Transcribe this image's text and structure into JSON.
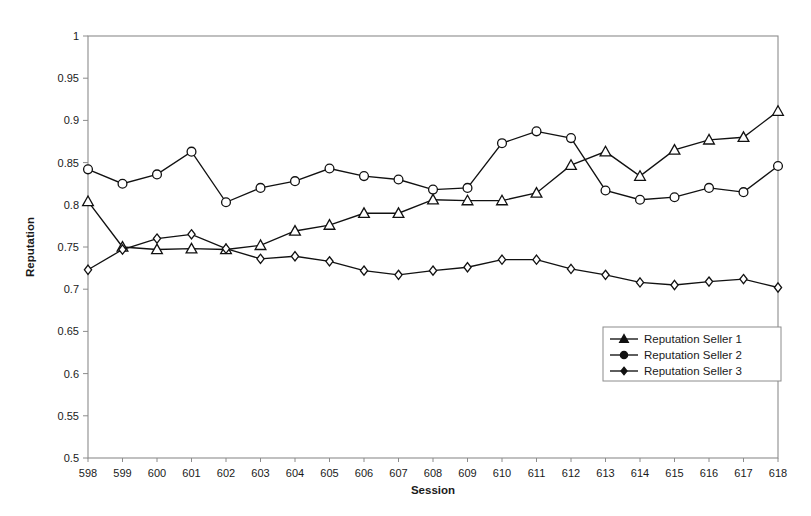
{
  "chart_data": {
    "type": "line",
    "title": "",
    "xlabel": "Session",
    "ylabel": "Reputation",
    "xlim": [
      598,
      618
    ],
    "ylim": [
      0.5,
      1.0
    ],
    "ytick_step": 0.05,
    "grid": false,
    "legend_position": "inside-lower-right",
    "x": [
      598,
      599,
      600,
      601,
      602,
      603,
      604,
      605,
      606,
      607,
      608,
      609,
      610,
      611,
      612,
      613,
      614,
      615,
      616,
      617,
      618
    ],
    "categories": [
      "598",
      "599",
      "600",
      "601",
      "602",
      "603",
      "604",
      "605",
      "606",
      "607",
      "608",
      "609",
      "610",
      "611",
      "612",
      "613",
      "614",
      "615",
      "616",
      "617",
      "618"
    ],
    "ytick_labels": [
      "1",
      "0.95",
      "0.9",
      "0.85",
      "0.8",
      "0.75",
      "0.7",
      "0.65",
      "0.6",
      "0.55",
      "0.5"
    ],
    "ytick_values": [
      1.0,
      0.95,
      0.9,
      0.85,
      0.8,
      0.75,
      0.7,
      0.65,
      0.6,
      0.55,
      0.5
    ],
    "series": [
      {
        "name": "Reputation Seller 1",
        "marker": "triangle",
        "values": [
          0.804,
          0.75,
          0.747,
          0.748,
          0.747,
          0.752,
          0.769,
          0.776,
          0.79,
          0.79,
          0.806,
          0.805,
          0.805,
          0.814,
          0.847,
          0.863,
          0.834,
          0.865,
          0.877,
          0.88,
          0.911
        ]
      },
      {
        "name": "Reputation Seller 2",
        "marker": "circle",
        "values": [
          0.842,
          0.825,
          0.836,
          0.863,
          0.803,
          0.82,
          0.828,
          0.843,
          0.834,
          0.83,
          0.818,
          0.82,
          0.873,
          0.887,
          0.879,
          0.817,
          0.806,
          0.809,
          0.82,
          0.815,
          0.846
        ]
      },
      {
        "name": "Reputation Seller 3",
        "marker": "diamond",
        "values": [
          0.723,
          0.747,
          0.76,
          0.765,
          0.748,
          0.736,
          0.739,
          0.733,
          0.722,
          0.717,
          0.722,
          0.726,
          0.735,
          0.735,
          0.724,
          0.717,
          0.708,
          0.705,
          0.709,
          0.712,
          0.702
        ]
      }
    ]
  },
  "legend": {
    "entries": [
      {
        "label": "Reputation Seller 1"
      },
      {
        "label": "Reputation Seller 2"
      },
      {
        "label": "Reputation Seller 3"
      }
    ]
  },
  "colors": {
    "line": "#111111",
    "frame": "#8c8c8c",
    "text": "#1a1a1a",
    "background": "#ffffff"
  }
}
